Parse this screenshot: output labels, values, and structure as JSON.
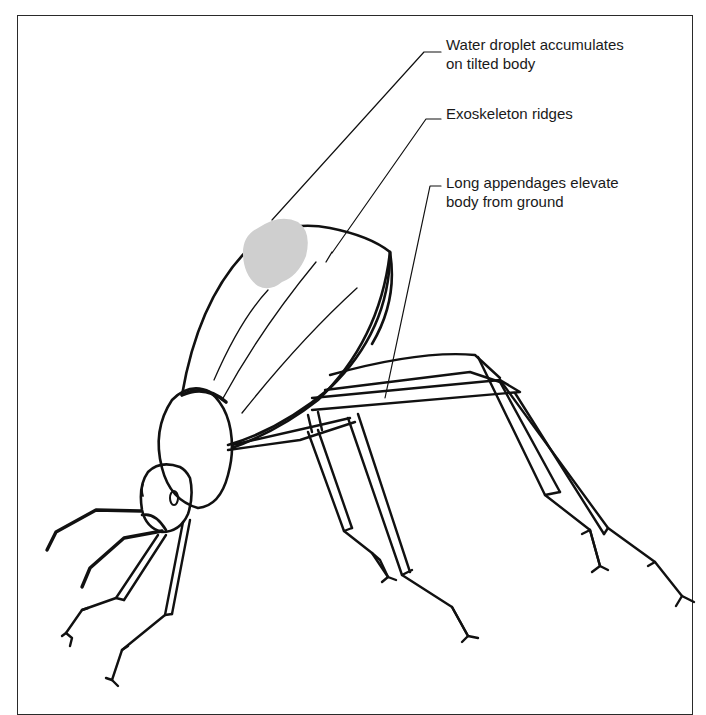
{
  "figure": {
    "droplet_color": "#cfcfcf",
    "line_color": "#111111",
    "labels": [
      {
        "id": "droplet",
        "lines": [
          "Water droplet accumulates",
          "on tilted body"
        ]
      },
      {
        "id": "ridges",
        "lines": [
          "Exoskeleton ridges"
        ]
      },
      {
        "id": "legs",
        "lines": [
          "Long appendages elevate",
          "body from ground"
        ]
      }
    ]
  }
}
